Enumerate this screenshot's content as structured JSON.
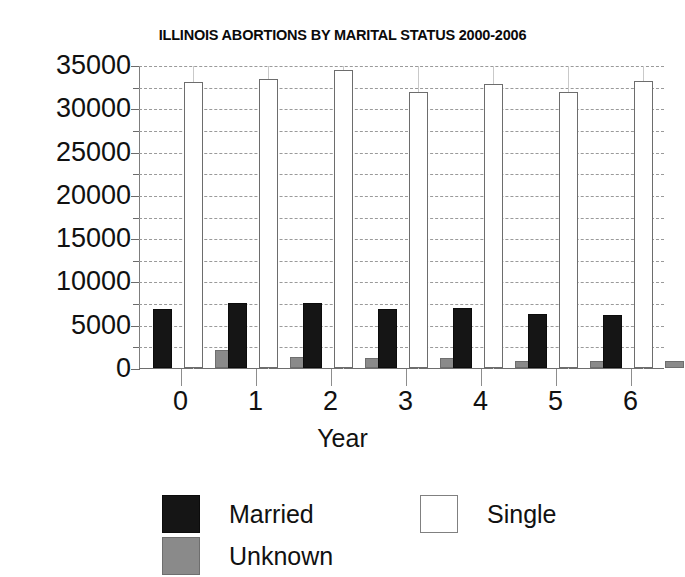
{
  "chart_data": {
    "type": "bar",
    "title": "ILLINOIS ABORTIONS BY MARITAL STATUS 2000-2006",
    "xlabel": "Year",
    "ylabel": "",
    "categories": [
      "0",
      "1",
      "2",
      "3",
      "4",
      "5",
      "6"
    ],
    "series": [
      {
        "name": "Married",
        "color": "#151515",
        "values": [
          6600,
          7300,
          7300,
          6600,
          6700,
          6000,
          5900
        ]
      },
      {
        "name": "Single",
        "color": "#ffffff",
        "values": [
          32800,
          33100,
          34200,
          31600,
          32600,
          31600,
          32900
        ]
      },
      {
        "name": "Unknown",
        "color": "#8a8a8a",
        "values": [
          1800,
          1050,
          950,
          950,
          580,
          580,
          580
        ]
      }
    ],
    "ylim": [
      0,
      35000
    ],
    "ytick_labels": [
      "0",
      "5000",
      "10000",
      "15000",
      "20000",
      "25000",
      "30000",
      "35000"
    ],
    "ytick_values": [
      0,
      5000,
      10000,
      15000,
      20000,
      25000,
      30000,
      35000
    ],
    "yminor_values": [
      2500,
      7500,
      12500,
      17500,
      22500,
      27500,
      32500
    ],
    "grid": true,
    "grid_interval": 2500,
    "legend_position": "bottom",
    "legend": [
      "Married",
      "Single",
      "Unknown"
    ]
  },
  "legend": {
    "married_label": "Married",
    "single_label": "Single",
    "unknown_label": "Unknown"
  }
}
